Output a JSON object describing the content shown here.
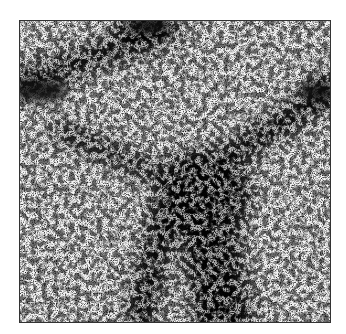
{
  "figure": {
    "frame": {
      "x": 19,
      "y": 20,
      "width": 312,
      "height": 303,
      "border_color": "#333333"
    },
    "colors": {
      "background": "#ffffff",
      "field_light": "#f4f4f4",
      "dense": "#111111"
    },
    "features": [
      {
        "name": "upper-left filament",
        "from": [
          0,
          60
        ],
        "to": [
          150,
          10
        ],
        "thickness": 26
      },
      {
        "name": "top clump",
        "center": [
          125,
          5
        ],
        "radius": 30
      },
      {
        "name": "right filament",
        "from": [
          312,
          70
        ],
        "to": [
          150,
          175
        ],
        "thickness": 28
      },
      {
        "name": "right node",
        "center": [
          305,
          72
        ],
        "radius": 22
      },
      {
        "name": "central node",
        "center": [
          185,
          175
        ],
        "radius": 50
      },
      {
        "name": "lower filament",
        "from": [
          185,
          175
        ],
        "to": [
          210,
          303
        ],
        "thickness": 60
      },
      {
        "name": "left diagonal",
        "from": [
          40,
          110
        ],
        "to": [
          185,
          175
        ],
        "thickness": 20
      }
    ]
  }
}
